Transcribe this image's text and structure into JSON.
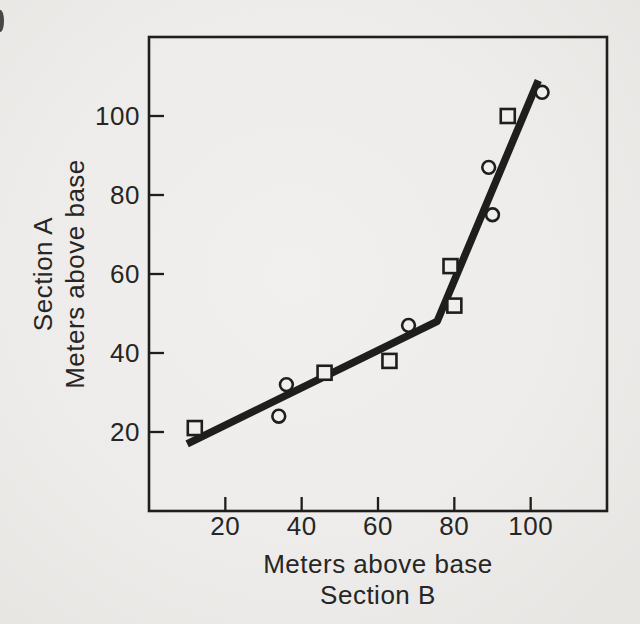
{
  "figure": {
    "paper_color": "#f0efed",
    "ink_color": "#1e1e1c",
    "text_color": "#262624"
  },
  "chart_data": {
    "type": "scatter",
    "title": "",
    "xlabel_lines": [
      "Meters above base",
      "Section B"
    ],
    "ylabel_lines": [
      "Section A",
      "Meters above base"
    ],
    "xlim": [
      0,
      120
    ],
    "ylim": [
      0,
      120
    ],
    "xticks": [
      20,
      40,
      60,
      80,
      100
    ],
    "yticks": [
      20,
      40,
      60,
      80,
      100
    ],
    "grid": false,
    "legend": "none",
    "tick_style": "inside",
    "series": [
      {
        "name": "circle-points",
        "marker": "circle",
        "points": [
          [
            34,
            24
          ],
          [
            36,
            32
          ],
          [
            68,
            47
          ],
          [
            89,
            87
          ],
          [
            90,
            75
          ],
          [
            103,
            106
          ]
        ]
      },
      {
        "name": "square-points",
        "marker": "square",
        "points": [
          [
            12,
            21
          ],
          [
            46,
            35
          ],
          [
            63,
            38
          ],
          [
            79,
            62
          ],
          [
            80,
            52
          ],
          [
            94,
            100
          ]
        ]
      }
    ],
    "fit_line": {
      "name": "piecewise-correlation-line",
      "points": [
        [
          10,
          17
        ],
        [
          75.5,
          48
        ],
        [
          102,
          109
        ]
      ]
    }
  }
}
